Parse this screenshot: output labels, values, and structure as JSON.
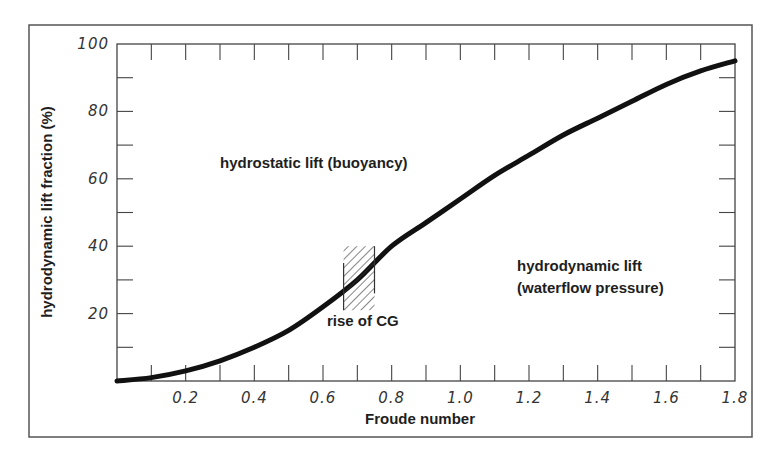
{
  "chart_data": {
    "type": "line",
    "title": "",
    "xlabel": "Froude number",
    "ylabel": "hydrodynamic lift fraction (%)",
    "xlim": [
      0,
      1.8
    ],
    "ylim": [
      0,
      100
    ],
    "grid": false,
    "legend": null,
    "x_ticks": [
      0.2,
      0.4,
      0.6,
      0.8,
      1.0,
      1.2,
      1.4,
      1.6,
      1.8
    ],
    "x_tick_labels": [
      "0.2",
      "0.4",
      "0.6",
      "0.8",
      "1.0",
      "1.2",
      "1.4",
      "1.6",
      "1.8"
    ],
    "x_minor_ticks": [
      0.1,
      0.3,
      0.5,
      0.7,
      0.9,
      1.1,
      1.3,
      1.5,
      1.7
    ],
    "y_ticks": [
      20,
      40,
      60,
      80,
      100
    ],
    "y_tick_labels": [
      "20",
      "40",
      "60",
      "80",
      "100"
    ],
    "y_minor_ticks": [
      10,
      30,
      50,
      70,
      90
    ],
    "series": [
      {
        "name": "hydrodynamic lift fraction",
        "x": [
          0.0,
          0.1,
          0.2,
          0.3,
          0.4,
          0.5,
          0.6,
          0.7,
          0.8,
          0.9,
          1.0,
          1.1,
          1.2,
          1.3,
          1.4,
          1.5,
          1.6,
          1.7,
          1.8
        ],
        "values": [
          0,
          1,
          3,
          6,
          10,
          15,
          22,
          30,
          40,
          47,
          54,
          61,
          67,
          73,
          78,
          83,
          88,
          92,
          95
        ]
      }
    ],
    "annotations": [
      {
        "text": "hydrostatic lift (buoyancy)",
        "x": 0.5,
        "y": 62
      },
      {
        "text": "hydrodynamic lift",
        "x": 1.2,
        "y": 35
      },
      {
        "text": "(waterflow pressure)",
        "x": 1.2,
        "y": 28
      },
      {
        "text": "rise of CG",
        "x": 0.75,
        "y": 12,
        "region": {
          "x_from": 0.66,
          "x_to": 0.75,
          "y_from": 21,
          "y_to": 40,
          "style": "hatched"
        }
      }
    ]
  },
  "labels": {
    "xlabel": "Froude number",
    "ylabel": "hydrodynamic lift fraction (%)",
    "region_above": "hydrostatic lift (buoyancy)",
    "region_below_line1": "hydrodynamic lift",
    "region_below_line2": "(waterflow pressure)",
    "cg_label": "rise of CG"
  },
  "colors": {
    "line": "#111111",
    "axis": "#444444",
    "text": "#1e1e1e",
    "background": "#ffffff"
  }
}
